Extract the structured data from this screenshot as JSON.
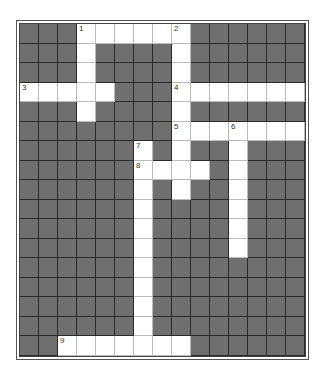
{
  "puzzle": {
    "type": "crossword",
    "rows": 17,
    "cols": 15,
    "colors": {
      "block": "#6f6f6f",
      "open": "#ffffff",
      "gridline": "#2a2a2a"
    },
    "open_cells": [
      [
        0,
        3
      ],
      [
        0,
        4
      ],
      [
        0,
        5
      ],
      [
        0,
        6
      ],
      [
        0,
        7
      ],
      [
        0,
        8
      ],
      [
        1,
        3
      ],
      [
        1,
        8
      ],
      [
        2,
        3
      ],
      [
        2,
        8
      ],
      [
        3,
        0
      ],
      [
        3,
        1
      ],
      [
        3,
        2
      ],
      [
        3,
        3
      ],
      [
        3,
        4
      ],
      [
        3,
        8
      ],
      [
        3,
        9
      ],
      [
        3,
        10
      ],
      [
        3,
        11
      ],
      [
        3,
        12
      ],
      [
        3,
        13
      ],
      [
        3,
        14
      ],
      [
        4,
        3
      ],
      [
        4,
        8
      ],
      [
        5,
        8
      ],
      [
        5,
        9
      ],
      [
        5,
        10
      ],
      [
        5,
        11
      ],
      [
        5,
        12
      ],
      [
        5,
        13
      ],
      [
        5,
        14
      ],
      [
        6,
        6
      ],
      [
        6,
        8
      ],
      [
        6,
        11
      ],
      [
        7,
        6
      ],
      [
        7,
        7
      ],
      [
        7,
        8
      ],
      [
        7,
        9
      ],
      [
        7,
        11
      ],
      [
        8,
        6
      ],
      [
        8,
        8
      ],
      [
        8,
        11
      ],
      [
        9,
        6
      ],
      [
        9,
        11
      ],
      [
        10,
        6
      ],
      [
        10,
        11
      ],
      [
        11,
        6
      ],
      [
        11,
        11
      ],
      [
        12,
        6
      ],
      [
        13,
        6
      ],
      [
        14,
        6
      ],
      [
        15,
        6
      ],
      [
        16,
        2
      ],
      [
        16,
        3
      ],
      [
        16,
        4
      ],
      [
        16,
        5
      ],
      [
        16,
        6
      ],
      [
        16,
        7
      ],
      [
        16,
        8
      ]
    ],
    "numbers": [
      {
        "label": "1",
        "row": 0,
        "col": 3
      },
      {
        "label": "2",
        "row": 0,
        "col": 8
      },
      {
        "label": "3",
        "row": 3,
        "col": 0
      },
      {
        "label": "4",
        "row": 3,
        "col": 8
      },
      {
        "label": "5",
        "row": 5,
        "col": 8
      },
      {
        "label": "6",
        "row": 5,
        "col": 11
      },
      {
        "label": "7",
        "row": 6,
        "col": 6
      },
      {
        "label": "8",
        "row": 7,
        "col": 6
      },
      {
        "label": "9",
        "row": 16,
        "col": 2
      }
    ]
  }
}
